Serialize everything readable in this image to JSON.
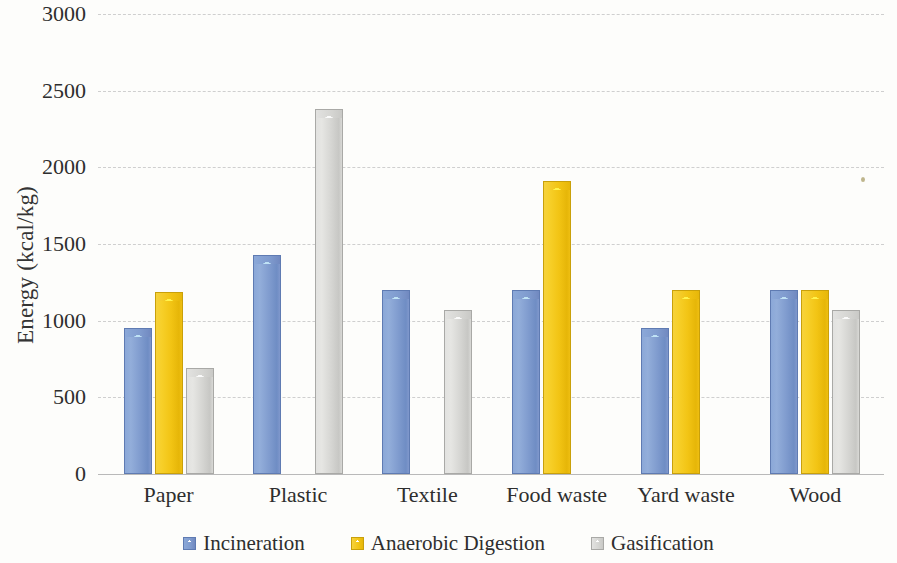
{
  "chart_data": {
    "type": "bar",
    "title": "",
    "xlabel": "",
    "ylabel": "Energy (kcal/kg)",
    "ylim": [
      0,
      3000
    ],
    "ytick_step": 500,
    "yticks": [
      3000,
      2500,
      2000,
      1500,
      1000,
      500,
      0
    ],
    "ytick_labels": [
      "3000",
      "2500",
      "2000",
      "1500",
      "1000",
      "500",
      "0"
    ],
    "grid": true,
    "grid_style": "dashed horizontal",
    "legend_position": "bottom-center",
    "categories": [
      "Paper",
      "Plastic",
      "Textile",
      "Food waste",
      "Yard waste",
      "Wood"
    ],
    "series": [
      {
        "name": "Incineration",
        "color": "#7f9bce",
        "values": [
          950,
          1430,
          1200,
          1200,
          955,
          1200
        ]
      },
      {
        "name": "Anaerobic Digestion",
        "color": "#f2c414",
        "values": [
          1190,
          null,
          null,
          1910,
          1200,
          1200
        ]
      },
      {
        "name": "Gasification",
        "color": "#d5d5d2",
        "values": [
          690,
          2380,
          1070,
          null,
          null,
          1070
        ]
      }
    ]
  },
  "legend": {
    "items": [
      {
        "label": "Incineration",
        "swatch": "blue-square-swatch"
      },
      {
        "label": "Anaerobic Digestion",
        "swatch": "yellow-square-swatch"
      },
      {
        "label": "Gasification",
        "swatch": "gray-square-swatch"
      }
    ]
  },
  "colors": {
    "incineration": "#7f9bce",
    "anaerobic_digestion": "#f2c414",
    "gasification": "#d5d5d2",
    "gridline": "#cfcfcf",
    "axis": "#b9b9b9",
    "background": "#fdfdfb",
    "text": "#2e2e2e"
  }
}
